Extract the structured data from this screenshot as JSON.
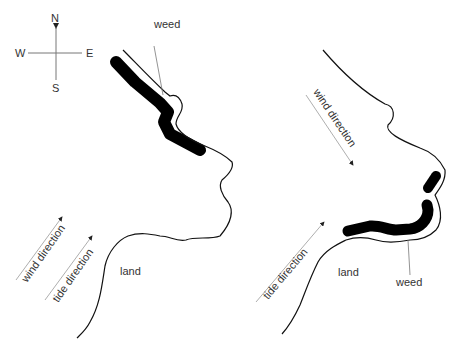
{
  "compass": {
    "north": "N",
    "south": "S",
    "east": "E",
    "west": "W"
  },
  "left_map": {
    "weed_label": "weed",
    "land_label": "land",
    "wind_label": "wind direction",
    "tide_label": "tide direction"
  },
  "right_map": {
    "weed_label": "weed",
    "land_label": "land",
    "wind_label": "wind direction",
    "tide_label": "tide direction"
  },
  "colors": {
    "line": "#1a1a1a",
    "weed": "#000000",
    "arrow": "#888888",
    "text": "#333333"
  }
}
